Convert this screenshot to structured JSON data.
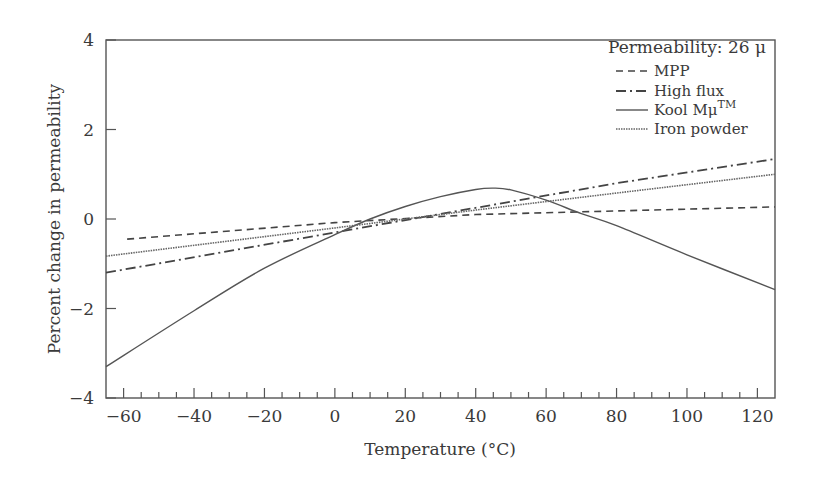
{
  "chart_data": {
    "type": "line",
    "title": "",
    "xlabel": "Temperature (°C)",
    "ylabel": "Percent change in permeability",
    "xlim": [
      -65,
      125
    ],
    "ylim": [
      -4,
      4
    ],
    "xticks": [
      -60,
      -40,
      -20,
      0,
      20,
      40,
      60,
      80,
      100,
      120
    ],
    "xtick_labels": [
      "−60",
      "−40",
      "−20",
      "0",
      "20",
      "40",
      "60",
      "80",
      "100",
      "120"
    ],
    "x_minor_tick_step": 5,
    "yticks": [
      -4,
      -2,
      0,
      2,
      4
    ],
    "ytick_labels": [
      "−4",
      "−2",
      "0",
      "2",
      "4"
    ],
    "grid": false,
    "legend": {
      "position": "upper right",
      "title": "Permeability: 26 μ",
      "entries": [
        "MPP",
        "High flux",
        "Kool Mμ™",
        "Iron powder"
      ]
    },
    "series": [
      {
        "name": "MPP",
        "style": "dashed",
        "x": [
          -59,
          0,
          40,
          80,
          125
        ],
        "y": [
          -0.45,
          -0.08,
          0.1,
          0.18,
          0.27
        ]
      },
      {
        "name": "High flux",
        "style": "dashdot",
        "x": [
          -65,
          0,
          40,
          80,
          125
        ],
        "y": [
          -1.2,
          -0.3,
          0.25,
          0.8,
          1.34
        ]
      },
      {
        "name": "Kool Mμ™",
        "style": "solid",
        "x": [
          -65,
          -40,
          -20,
          0,
          10,
          20,
          30,
          40,
          45,
          50,
          60,
          70,
          80,
          100,
          125
        ],
        "y": [
          -3.3,
          -2.05,
          -1.1,
          -0.35,
          0.0,
          0.28,
          0.5,
          0.66,
          0.69,
          0.65,
          0.42,
          0.12,
          -0.15,
          -0.8,
          -1.58
        ]
      },
      {
        "name": "Iron powder",
        "style": "dotted",
        "x": [
          -65,
          0,
          40,
          80,
          125
        ],
        "y": [
          -0.83,
          -0.2,
          0.2,
          0.58,
          1.0
        ]
      }
    ]
  }
}
